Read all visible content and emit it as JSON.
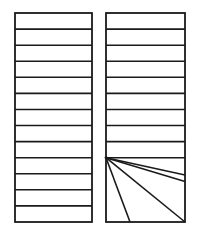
{
  "figure": {
    "canvas": {
      "width": 199,
      "height": 232,
      "background": "#ffffff"
    },
    "stroke": {
      "color": "#1a1a1a",
      "outline_width": 1.8,
      "line_width": 1.6
    },
    "panels": [
      {
        "name": "left-panel",
        "label": "Left rectangle with horizontal stripes",
        "x": 15,
        "y": 13,
        "width": 77,
        "height": 209,
        "band_count": 13,
        "band_height": 16.08,
        "divider_y": [
          29.1,
          45.2,
          61.2,
          77.3,
          93.4,
          109.5,
          125.5,
          141.6,
          157.7,
          173.8,
          189.8,
          205.9
        ],
        "fan": null
      },
      {
        "name": "right-panel",
        "label": "Right rectangle with horizontal stripes and a fan of rays",
        "x": 106,
        "y": 13,
        "width": 79,
        "height": 209,
        "band_count": 13,
        "band_height": 16.08,
        "divider_y": [
          29.1,
          45.2,
          61.2,
          77.3,
          93.4,
          109.5,
          125.5,
          141.6,
          157.7
        ],
        "fan": {
          "apex_x": 106,
          "apex_y": 157.7,
          "ray_count": 4,
          "endpoints": [
            {
              "x": 185,
              "y": 175.0
            },
            {
              "x": 185,
              "y": 181.5
            },
            {
              "x": 185,
              "y": 222
            },
            {
              "x": 130,
              "y": 222
            }
          ]
        }
      }
    ]
  }
}
